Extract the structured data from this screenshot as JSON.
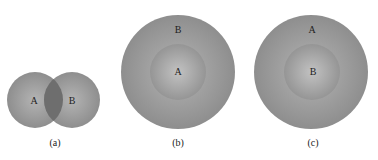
{
  "diagram": {
    "type": "set-relationship-diagrams",
    "panels": [
      {
        "caption": "(a)",
        "relation": "overlap",
        "sets": [
          "A",
          "B"
        ],
        "labels": {
          "left": "A",
          "right": "B"
        }
      },
      {
        "caption": "(b)",
        "relation": "A subset of B",
        "labels": {
          "outer": "B",
          "inner": "A"
        }
      },
      {
        "caption": "(c)",
        "relation": "B subset of A",
        "labels": {
          "outer": "A",
          "inner": "B"
        }
      }
    ],
    "colors": {
      "circle": "#9a9a9a",
      "inner": "#a8a8a8",
      "overlap": "#6e6e6e",
      "text": "#222222"
    }
  }
}
